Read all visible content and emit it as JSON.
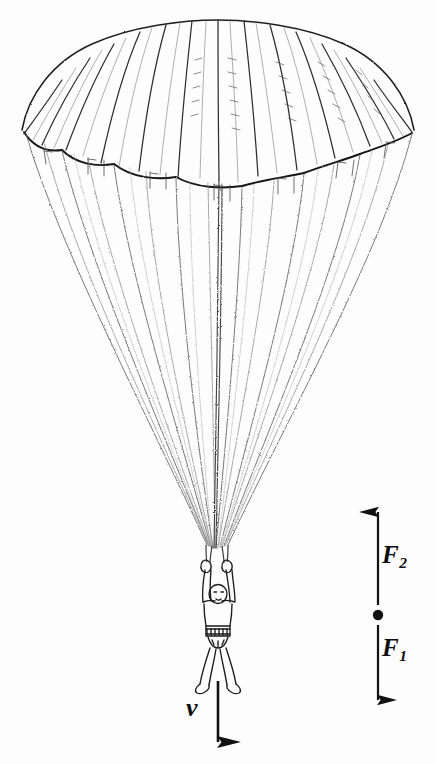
{
  "figure": {
    "background_color": "#fdfdfd",
    "ink_color": "#1a1a1a",
    "subject": {
      "name": "parachutist",
      "canopy": {
        "name": "round-parachute-canopy",
        "gore_count": 13,
        "suspension_line_count": 14
      },
      "skydiver": {
        "name": "skydiver-figure",
        "pose": "arms raised holding risers, legs apart"
      }
    },
    "vectors": [
      {
        "id": "F2",
        "label": "F",
        "subscript": "2",
        "direction": "up",
        "name": "force-vector-f2",
        "meaning": "upward drag force"
      },
      {
        "id": "F1",
        "label": "F",
        "subscript": "1",
        "direction": "down",
        "name": "force-vector-f1",
        "meaning": "downward weight force"
      },
      {
        "id": "v",
        "label": "v",
        "subscript": "",
        "direction": "down",
        "name": "velocity-vector-v",
        "meaning": "downward velocity"
      }
    ],
    "center_point": {
      "name": "center-of-mass-dot",
      "visible": true
    }
  }
}
